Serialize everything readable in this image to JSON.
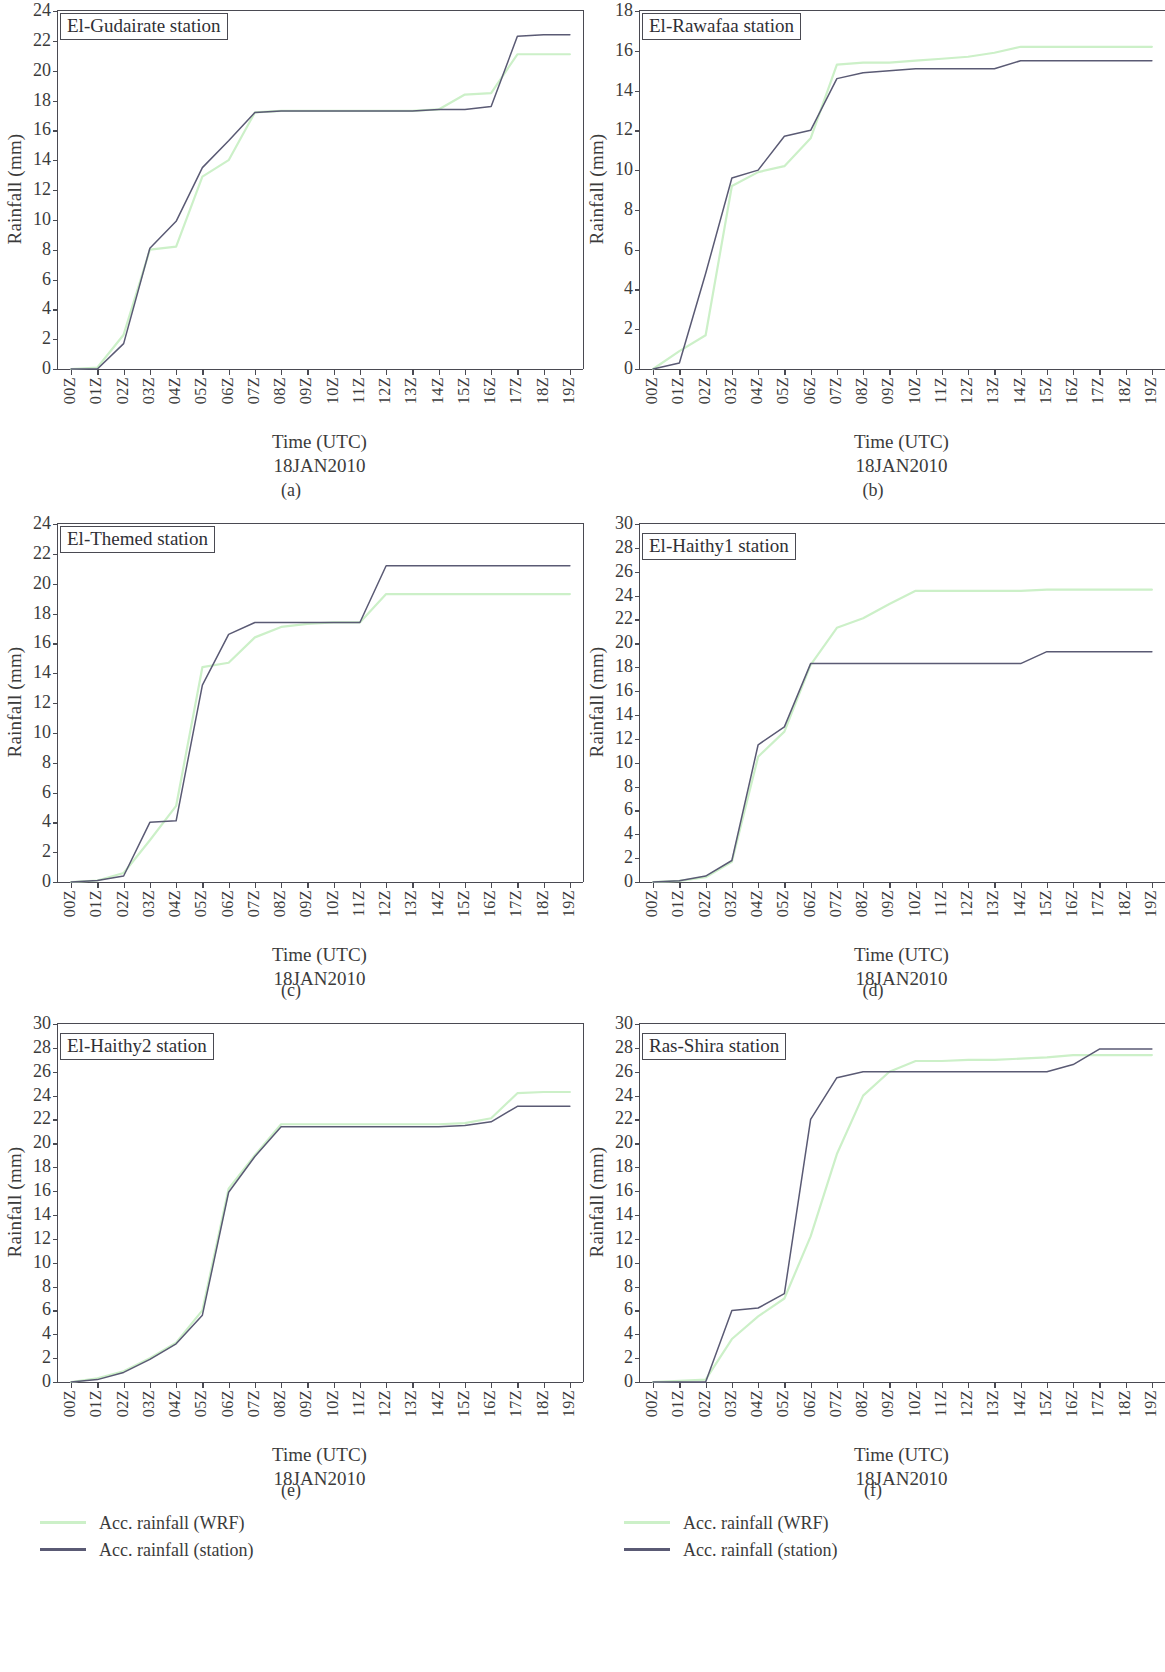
{
  "figure": {
    "xaxis_title_line1": "Time (UTC)",
    "xaxis_title_line2": "18JAN2010",
    "yaxis_title": "Rainfall (mm)",
    "x_categories": [
      "00Z",
      "01Z",
      "02Z",
      "03Z",
      "04Z",
      "05Z",
      "06Z",
      "07Z",
      "08Z",
      "09Z",
      "10Z",
      "11Z",
      "12Z",
      "13Z",
      "14Z",
      "15Z",
      "16Z",
      "17Z",
      "18Z",
      "19Z"
    ],
    "colors": {
      "wrf": "#ccf0c8",
      "station": "#5a5a74",
      "axis": "#4a4a52",
      "text": "#3b3b3b"
    },
    "legend": {
      "wrf_label": "Acc. rainfall (WRF)",
      "station_label": "Acc. rainfall (station)"
    },
    "captions": [
      "(a)",
      "(b)",
      "(c)",
      "(d)",
      "(e)",
      "(f)"
    ]
  },
  "chart_data": [
    {
      "type": "line",
      "caption": "(a)",
      "title": "El-Gudairate station",
      "xlabel": "Time (UTC) 18JAN2010",
      "ylabel": "Rainfall (mm)",
      "ylim": [
        0,
        24
      ],
      "yticks": [
        0,
        2,
        4,
        6,
        8,
        10,
        12,
        14,
        16,
        18,
        20,
        22,
        24
      ],
      "grid": false,
      "legend_position": "bottom-left",
      "x": [
        "00Z",
        "01Z",
        "02Z",
        "03Z",
        "04Z",
        "05Z",
        "06Z",
        "07Z",
        "08Z",
        "09Z",
        "10Z",
        "11Z",
        "12Z",
        "13Z",
        "14Z",
        "15Z",
        "16Z",
        "17Z",
        "18Z",
        "19Z"
      ],
      "series": [
        {
          "name": "Acc. rainfall (WRF)",
          "color": "#ccf0c8",
          "values": [
            0.0,
            0.1,
            2.3,
            8.0,
            8.2,
            12.9,
            14.0,
            17.2,
            17.3,
            17.3,
            17.3,
            17.3,
            17.3,
            17.3,
            17.4,
            18.4,
            18.5,
            21.1,
            21.1,
            21.1
          ]
        },
        {
          "name": "Acc. rainfall (station)",
          "color": "#5a5a74",
          "values": [
            0.0,
            0.0,
            1.7,
            8.1,
            9.9,
            13.5,
            15.3,
            17.2,
            17.3,
            17.3,
            17.3,
            17.3,
            17.3,
            17.3,
            17.4,
            17.4,
            17.6,
            22.3,
            22.4,
            22.4
          ]
        }
      ]
    },
    {
      "type": "line",
      "caption": "(b)",
      "title": "El-Rawafaa station",
      "xlabel": "Time (UTC) 18JAN2010",
      "ylabel": "Rainfall (mm)",
      "ylim": [
        0,
        18
      ],
      "yticks": [
        0,
        2,
        4,
        6,
        8,
        10,
        12,
        14,
        16,
        18
      ],
      "grid": false,
      "legend_position": "none",
      "x": [
        "00Z",
        "01Z",
        "02Z",
        "03Z",
        "04Z",
        "05Z",
        "06Z",
        "07Z",
        "08Z",
        "09Z",
        "10Z",
        "11Z",
        "12Z",
        "13Z",
        "14Z",
        "15Z",
        "16Z",
        "17Z",
        "18Z",
        "19Z"
      ],
      "series": [
        {
          "name": "Acc. rainfall (WRF)",
          "color": "#ccf0c8",
          "values": [
            0.0,
            0.9,
            1.7,
            9.2,
            9.9,
            10.2,
            11.6,
            15.3,
            15.4,
            15.4,
            15.5,
            15.6,
            15.7,
            15.9,
            16.2,
            16.2,
            16.2,
            16.2,
            16.2,
            16.2
          ]
        },
        {
          "name": "Acc. rainfall (station)",
          "color": "#5a5a74",
          "values": [
            0.0,
            0.3,
            4.8,
            9.6,
            10.0,
            11.7,
            12.0,
            14.6,
            14.9,
            15.0,
            15.1,
            15.1,
            15.1,
            15.1,
            15.5,
            15.5,
            15.5,
            15.5,
            15.5,
            15.5
          ]
        }
      ]
    },
    {
      "type": "line",
      "caption": "(c)",
      "title": "El-Themed station",
      "xlabel": "Time (UTC) 18JAN2010",
      "ylabel": "Rainfall (mm)",
      "ylim": [
        0,
        24
      ],
      "yticks": [
        0,
        2,
        4,
        6,
        8,
        10,
        12,
        14,
        16,
        18,
        20,
        22,
        24
      ],
      "grid": false,
      "legend_position": "none",
      "x": [
        "00Z",
        "01Z",
        "02Z",
        "03Z",
        "04Z",
        "05Z",
        "06Z",
        "07Z",
        "08Z",
        "09Z",
        "10Z",
        "11Z",
        "12Z",
        "13Z",
        "14Z",
        "15Z",
        "16Z",
        "17Z",
        "18Z",
        "19Z"
      ],
      "series": [
        {
          "name": "Acc. rainfall (WRF)",
          "color": "#ccf0c8",
          "values": [
            0.0,
            0.1,
            0.6,
            2.8,
            5.1,
            14.4,
            14.7,
            16.4,
            17.1,
            17.3,
            17.4,
            17.4,
            19.3,
            19.3,
            19.3,
            19.3,
            19.3,
            19.3,
            19.3,
            19.3
          ]
        },
        {
          "name": "Acc. rainfall (station)",
          "color": "#5a5a74",
          "values": [
            0.0,
            0.1,
            0.4,
            4.0,
            4.1,
            13.2,
            16.6,
            17.4,
            17.4,
            17.4,
            17.4,
            17.4,
            21.2,
            21.2,
            21.2,
            21.2,
            21.2,
            21.2,
            21.2,
            21.2
          ]
        }
      ]
    },
    {
      "type": "line",
      "caption": "(d)",
      "title": "El-Haithy1 station",
      "xlabel": "Time (UTC) 18JAN2010",
      "ylabel": "Rainfall (mm)",
      "ylim": [
        0,
        30
      ],
      "yticks": [
        0,
        2,
        4,
        6,
        8,
        10,
        12,
        14,
        16,
        18,
        20,
        22,
        24,
        26,
        28,
        30
      ],
      "grid": false,
      "legend_position": "none",
      "x": [
        "00Z",
        "01Z",
        "02Z",
        "03Z",
        "04Z",
        "05Z",
        "06Z",
        "07Z",
        "08Z",
        "09Z",
        "10Z",
        "11Z",
        "12Z",
        "13Z",
        "14Z",
        "15Z",
        "16Z",
        "17Z",
        "18Z",
        "19Z"
      ],
      "series": [
        {
          "name": "Acc. rainfall (WRF)",
          "color": "#ccf0c8",
          "values": [
            0.0,
            0.1,
            0.4,
            1.7,
            10.5,
            12.6,
            18.2,
            21.3,
            22.1,
            23.3,
            24.4,
            24.4,
            24.4,
            24.4,
            24.4,
            24.5,
            24.5,
            24.5,
            24.5,
            24.5
          ]
        },
        {
          "name": "Acc. rainfall (station)",
          "color": "#5a5a74",
          "values": [
            0.0,
            0.1,
            0.5,
            1.8,
            11.5,
            13.0,
            18.3,
            18.3,
            18.3,
            18.3,
            18.3,
            18.3,
            18.3,
            18.3,
            18.3,
            19.3,
            19.3,
            19.3,
            19.3,
            19.3
          ]
        }
      ]
    },
    {
      "type": "line",
      "caption": "(e)",
      "title": "El-Haithy2 station",
      "xlabel": "Time (UTC) 18JAN2010",
      "ylabel": "Rainfall (mm)",
      "ylim": [
        0,
        30
      ],
      "yticks": [
        0,
        2,
        4,
        6,
        8,
        10,
        12,
        14,
        16,
        18,
        20,
        22,
        24,
        26,
        28,
        30
      ],
      "grid": false,
      "legend_position": "bottom-left",
      "x": [
        "00Z",
        "01Z",
        "02Z",
        "03Z",
        "04Z",
        "05Z",
        "06Z",
        "07Z",
        "08Z",
        "09Z",
        "10Z",
        "11Z",
        "12Z",
        "13Z",
        "14Z",
        "15Z",
        "16Z",
        "17Z",
        "18Z",
        "19Z"
      ],
      "series": [
        {
          "name": "Acc. rainfall (WRF)",
          "color": "#ccf0c8",
          "values": [
            0.0,
            0.3,
            0.9,
            2.0,
            3.3,
            6.0,
            16.2,
            19.0,
            21.6,
            21.6,
            21.6,
            21.6,
            21.6,
            21.6,
            21.6,
            21.7,
            22.1,
            24.2,
            24.3,
            24.3
          ]
        },
        {
          "name": "Acc. rainfall (station)",
          "color": "#5a5a74",
          "values": [
            0.0,
            0.2,
            0.8,
            1.9,
            3.2,
            5.6,
            15.9,
            18.9,
            21.4,
            21.4,
            21.4,
            21.4,
            21.4,
            21.4,
            21.4,
            21.5,
            21.8,
            23.1,
            23.1,
            23.1
          ]
        }
      ]
    },
    {
      "type": "line",
      "caption": "(f)",
      "title": "Ras-Shira station",
      "xlabel": "Time (UTC) 18JAN2010",
      "ylabel": "Rainfall (mm)",
      "ylim": [
        0,
        30
      ],
      "yticks": [
        0,
        2,
        4,
        6,
        8,
        10,
        12,
        14,
        16,
        18,
        20,
        22,
        24,
        26,
        28,
        30
      ],
      "grid": false,
      "legend_position": "bottom-left",
      "x": [
        "00Z",
        "01Z",
        "02Z",
        "03Z",
        "04Z",
        "05Z",
        "06Z",
        "07Z",
        "08Z",
        "09Z",
        "10Z",
        "11Z",
        "12Z",
        "13Z",
        "14Z",
        "15Z",
        "16Z",
        "17Z",
        "18Z",
        "19Z"
      ],
      "series": [
        {
          "name": "Acc. rainfall (WRF)",
          "color": "#ccf0c8",
          "values": [
            0.0,
            0.1,
            0.2,
            3.6,
            5.5,
            7.0,
            12.2,
            19.1,
            24.0,
            26.0,
            26.9,
            26.9,
            27.0,
            27.0,
            27.1,
            27.2,
            27.4,
            27.4,
            27.4,
            27.4
          ]
        },
        {
          "name": "Acc. rainfall (station)",
          "color": "#5a5a74",
          "values": [
            0.0,
            0.0,
            0.0,
            6.0,
            6.2,
            7.4,
            22.0,
            25.5,
            26.0,
            26.0,
            26.0,
            26.0,
            26.0,
            26.0,
            26.0,
            26.0,
            26.6,
            27.9,
            27.9,
            27.9
          ]
        }
      ]
    }
  ]
}
